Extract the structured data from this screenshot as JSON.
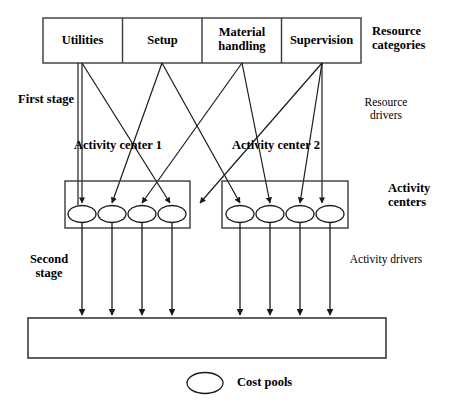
{
  "diagram": {
    "resource_categories": {
      "group_label": "Resource categories",
      "items": [
        {
          "label": "Utilities"
        },
        {
          "label": "Setup"
        },
        {
          "label": "Material handling"
        },
        {
          "label": "Supervision"
        }
      ]
    },
    "stages": [
      {
        "label": "First stage",
        "driver_label": "Resource drivers"
      },
      {
        "label": "Second stage",
        "driver_label": "Activity drivers"
      }
    ],
    "activity_centers": {
      "group_label": "Activity centers",
      "items": [
        {
          "label": "Activity center 1",
          "pool_count": 4
        },
        {
          "label": "Activity center 2",
          "pool_count": 4
        }
      ]
    },
    "cost_object_box": {
      "label": ""
    },
    "legend": {
      "symbol": "oval",
      "label": "Cost pools"
    },
    "colors": {
      "line": "#1a1a1a",
      "box_border": "#3a3a3a",
      "background": "#ffffff",
      "text": "#000000"
    }
  }
}
